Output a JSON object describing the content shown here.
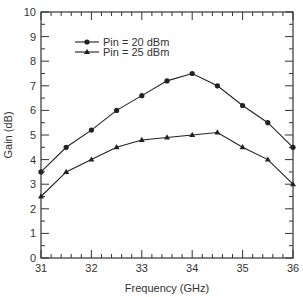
{
  "chart_data": {
    "type": "line",
    "title": "",
    "xlabel": "Frequency (GHz)",
    "ylabel": "Gain (dB)",
    "xlim": [
      31,
      36
    ],
    "ylim": [
      0,
      10
    ],
    "x_ticks": [
      31,
      32,
      33,
      34,
      35,
      36
    ],
    "y_ticks": [
      0,
      1,
      2,
      3,
      4,
      5,
      6,
      7,
      8,
      9,
      10
    ],
    "grid": false,
    "legend_position": "upper-left",
    "x": [
      31,
      31.5,
      32,
      32.5,
      33,
      33.5,
      34,
      34.5,
      35,
      35.5,
      36
    ],
    "series": [
      {
        "name": "Pin = 20 dBm",
        "marker": "circle",
        "values": [
          3.5,
          4.5,
          5.2,
          6.0,
          6.6,
          7.2,
          7.5,
          7.0,
          6.2,
          5.5,
          4.5
        ]
      },
      {
        "name": "Pin = 25 dBm",
        "marker": "triangle",
        "values": [
          2.5,
          3.5,
          4.0,
          4.5,
          4.8,
          4.9,
          5.0,
          5.1,
          4.5,
          4.0,
          3.0
        ]
      }
    ]
  },
  "colors": {
    "line": "#222222",
    "axis": "#333333"
  }
}
